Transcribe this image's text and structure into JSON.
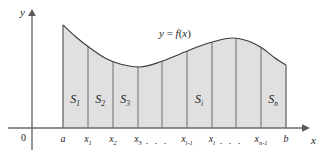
{
  "figure": {
    "background_color": "#ffffff",
    "ink_color": "#1b1b1b",
    "fill_color": "#e0e0e0",
    "curve_color": "#3a3a3a",
    "divider_color": "#6e6e6e"
  },
  "axes": {
    "y_label": "y",
    "x_label": "x",
    "origin_label": "0",
    "x_axis_y": 128,
    "y_axis_x": 32
  },
  "function_label": "y = f(x)",
  "function_label_parts": {
    "y": "y",
    "equals": "=",
    "f": "f",
    "open": "(",
    "x": "x",
    "close": ")"
  },
  "ticks": [
    {
      "name": "a",
      "base": "a",
      "sub": "",
      "x": 63
    },
    {
      "name": "x1",
      "base": "x",
      "sub": "1",
      "x": 88
    },
    {
      "name": "x2",
      "base": "x",
      "sub": "2",
      "x": 113
    },
    {
      "name": "x3",
      "base": "x",
      "sub": "3",
      "x": 138
    },
    {
      "name": "xi-1",
      "base": "x",
      "sub": "i-1",
      "x": 187
    },
    {
      "name": "xi",
      "base": "x",
      "sub": "i",
      "x": 212
    },
    {
      "name": "xn-1",
      "base": "x",
      "sub": "n-1",
      "x": 261
    },
    {
      "name": "b",
      "base": "b",
      "sub": "",
      "x": 286
    }
  ],
  "ellipses": [
    {
      "name": "ellipsis-left",
      "text": ". . .",
      "x": 157
    },
    {
      "name": "ellipsis-right",
      "text": ". . .",
      "x": 231
    }
  ],
  "regions": [
    {
      "name": "S1",
      "base": "S",
      "sub": "1",
      "x": 75
    },
    {
      "name": "S2",
      "base": "S",
      "sub": "2",
      "x": 100
    },
    {
      "name": "S3",
      "base": "S",
      "sub": "3",
      "x": 125
    },
    {
      "name": "Si",
      "base": "S",
      "sub": "i",
      "x": 199
    },
    {
      "name": "Sn",
      "base": "S",
      "sub": "n",
      "x": 273
    }
  ],
  "dividers": [
    63,
    88,
    113,
    138,
    162,
    187,
    212,
    236,
    261,
    286
  ],
  "chart_data": {
    "type": "area",
    "xlabel": "x",
    "ylabel": "y",
    "x_of_a": 63,
    "x_of_b": 286,
    "baseline_y": 128,
    "curve_points": [
      {
        "x": 63,
        "y": 25
      },
      {
        "x": 76,
        "y": 37
      },
      {
        "x": 90,
        "y": 48
      },
      {
        "x": 105,
        "y": 58
      },
      {
        "x": 120,
        "y": 64
      },
      {
        "x": 140,
        "y": 67
      },
      {
        "x": 160,
        "y": 62
      },
      {
        "x": 180,
        "y": 54
      },
      {
        "x": 200,
        "y": 46
      },
      {
        "x": 216,
        "y": 41
      },
      {
        "x": 232,
        "y": 38
      },
      {
        "x": 248,
        "y": 41
      },
      {
        "x": 262,
        "y": 48
      },
      {
        "x": 275,
        "y": 58
      },
      {
        "x": 286,
        "y": 65
      }
    ],
    "bar_tops": [
      {
        "label": "S1",
        "left": 63,
        "right": 88
      },
      {
        "label": "S2",
        "left": 88,
        "right": 113
      },
      {
        "label": "S3",
        "left": 113,
        "right": 138
      },
      {
        "label": "",
        "left": 138,
        "right": 162
      },
      {
        "label": "",
        "left": 162,
        "right": 187
      },
      {
        "label": "Si",
        "left": 187,
        "right": 212
      },
      {
        "label": "",
        "left": 212,
        "right": 236
      },
      {
        "label": "",
        "left": 236,
        "right": 261
      },
      {
        "label": "Sn",
        "left": 261,
        "right": 286
      }
    ],
    "grid": false,
    "legend": "none"
  }
}
